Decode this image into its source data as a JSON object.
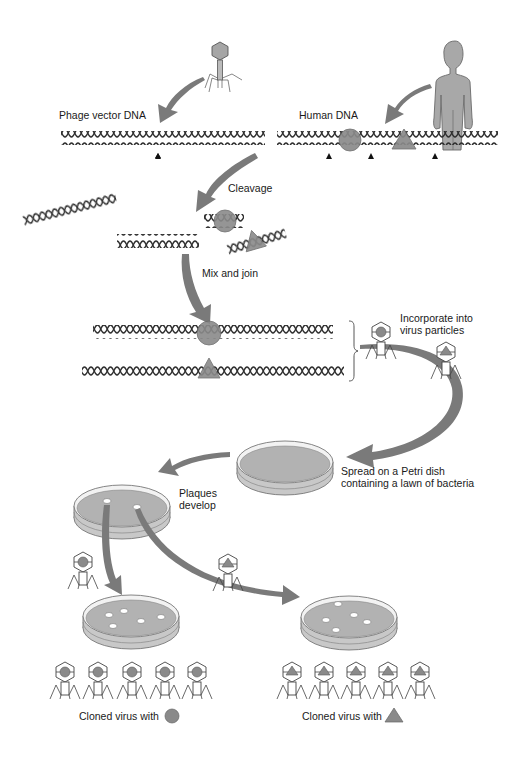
{
  "diagram": {
    "type": "process-flow",
    "topic": "Cloning human DNA fragments in a bacteriophage vector",
    "colors": {
      "arrow": "#7a7a7a",
      "shape_fill": "#8a8a8a",
      "shape_stroke": "#5a5a5a",
      "agar": "#b4b4b4",
      "dish_rim": "#d8d8d8",
      "dna": "#333333",
      "body": "#a8a8a8"
    },
    "labels": {
      "phage_vector_dna": "Phage vector DNA",
      "human_dna": "Human DNA",
      "cleavage": "Cleavage",
      "mix_and_join": "Mix and join",
      "incorporate_line1": "Incorporate into",
      "incorporate_line2": "virus particles",
      "spread_line1": "Spread on a Petri dish",
      "spread_line2": "containing a lawn of bacteria",
      "plaques_line1": "Plaques",
      "plaques_line2": "develop",
      "cloned_circle": "Cloned virus with",
      "cloned_triangle": "Cloned virus with"
    },
    "steps": [
      {
        "id": 1,
        "label": "Phage vector DNA",
        "source": "bacteriophage"
      },
      {
        "id": 2,
        "label": "Human DNA",
        "source": "human"
      },
      {
        "id": 3,
        "label": "Cleavage"
      },
      {
        "id": 4,
        "label": "Mix and join"
      },
      {
        "id": 5,
        "label": "Incorporate into virus particles"
      },
      {
        "id": 6,
        "label": "Spread on a Petri dish containing a lawn of bacteria"
      },
      {
        "id": 7,
        "label": "Plaques develop"
      },
      {
        "id": 8,
        "label": "Cloned virus with circle insert",
        "count": 5
      },
      {
        "id": 9,
        "label": "Cloned virus with triangle insert",
        "count": 5
      }
    ],
    "cut_sites": {
      "phage_vector": 1,
      "human": 3
    },
    "plaques": {
      "first_dish": 2,
      "left_clone_dish": 5,
      "right_clone_dish": 5
    }
  }
}
